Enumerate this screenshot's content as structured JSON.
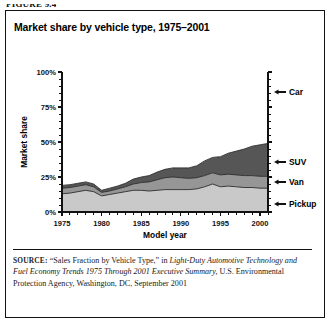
{
  "figure": {
    "label": "FIGURE 9.4"
  },
  "chart": {
    "title": "Market share by vehicle type, 1975–2001",
    "ylabel": "Market share",
    "xlabel": "Model year"
  },
  "legend": [
    {
      "name": "Car",
      "label": "Car",
      "color": "#ffffff"
    },
    {
      "name": "SUV",
      "label": "SUV",
      "color": "#565656"
    },
    {
      "name": "Van",
      "label": "Van",
      "color": "#969696"
    },
    {
      "name": "Pickup",
      "label": "Pickup",
      "color": "#c9c9c9"
    }
  ],
  "source": {
    "prefix": "SOURCE:",
    "part1": " “Sales Fraction by Vehicle Type,” in ",
    "italic1": "Light-Duty Automotive Technology and Fuel Economy Trends 1975 Through 2001 Executive Summary,",
    "part2": " U.S. Environmental Protection Agency, Washington, DC, September 2001"
  },
  "chart_data": {
    "type": "area",
    "title": "Market share by vehicle type, 1975–2001",
    "xlabel": "Model year",
    "ylabel": "Market share",
    "xlim": [
      1975,
      2001
    ],
    "ylim": [
      0,
      100
    ],
    "xticks": [
      1975,
      1980,
      1985,
      1990,
      1995,
      2000
    ],
    "xticklabels": [
      "1975",
      "1980",
      "1985",
      "1990",
      "1995",
      "2000"
    ],
    "yticks": [
      0,
      25,
      50,
      75,
      100
    ],
    "yticklabels": [
      "0%",
      "25%",
      "50%",
      "75%",
      "100%"
    ],
    "grid": false,
    "legend_position": "right-outside-arrows",
    "stacked": true,
    "stack_order_bottom_to_top": [
      "Pickup",
      "Van",
      "SUV",
      "Car"
    ],
    "x": [
      1975,
      1976,
      1977,
      1978,
      1979,
      1980,
      1981,
      1982,
      1983,
      1984,
      1985,
      1986,
      1987,
      1988,
      1989,
      1990,
      1991,
      1992,
      1993,
      1994,
      1995,
      1996,
      1997,
      1998,
      1999,
      2000,
      2001
    ],
    "series": [
      {
        "name": "Pickup",
        "color": "#c9c9c9",
        "values": [
          13.0,
          13.5,
          14.5,
          15.5,
          14.5,
          11.5,
          12.5,
          13.5,
          14.5,
          15.5,
          15.5,
          15.0,
          15.5,
          16.0,
          16.0,
          16.0,
          16.0,
          16.5,
          18.0,
          20.0,
          18.0,
          18.5,
          18.0,
          17.5,
          17.5,
          17.0,
          17.0
        ]
      },
      {
        "name": "Van",
        "color": "#969696",
        "values": [
          4.0,
          4.0,
          4.0,
          4.0,
          3.5,
          2.5,
          2.5,
          3.0,
          3.5,
          4.5,
          5.5,
          6.5,
          7.5,
          8.5,
          9.0,
          8.5,
          8.0,
          8.0,
          8.0,
          8.0,
          8.5,
          8.5,
          8.5,
          8.5,
          8.5,
          8.5,
          8.5
        ]
      },
      {
        "name": "SUV",
        "color": "#565656",
        "values": [
          2.0,
          2.0,
          2.0,
          2.0,
          2.0,
          1.5,
          2.0,
          2.0,
          2.5,
          3.5,
          4.0,
          4.5,
          5.5,
          6.0,
          6.5,
          7.0,
          7.5,
          8.5,
          10.5,
          11.0,
          13.0,
          15.0,
          17.0,
          19.0,
          21.0,
          22.5,
          23.5
        ]
      },
      {
        "name": "Car",
        "color": "#ffffff",
        "values": [
          81.0,
          80.5,
          79.5,
          78.5,
          80.0,
          84.5,
          83.0,
          81.5,
          79.5,
          76.5,
          75.0,
          74.0,
          71.5,
          69.5,
          68.5,
          68.5,
          68.5,
          67.0,
          63.5,
          61.0,
          60.5,
          58.0,
          56.5,
          55.0,
          53.0,
          52.0,
          51.0
        ]
      }
    ],
    "totals_non_car": [
      19.0,
      19.5,
      20.5,
      21.5,
      20.0,
      15.5,
      17.0,
      18.5,
      20.5,
      23.5,
      25.0,
      26.0,
      28.5,
      30.5,
      31.5,
      31.5,
      31.5,
      33.0,
      36.5,
      39.0,
      39.5,
      42.0,
      43.5,
      45.0,
      47.0,
      48.0,
      49.0
    ]
  }
}
